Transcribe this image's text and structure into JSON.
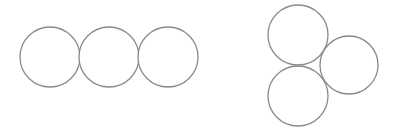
{
  "diagram": {
    "stroke_color": "#8a8a8a",
    "background": "#ffffff",
    "groups": [
      {
        "name": "linear-chain",
        "arrangement": "three circles in a horizontal row, touching",
        "circles": [
          {
            "cx": 50,
            "cy": 57,
            "r": 30
          },
          {
            "cx": 109,
            "cy": 57,
            "r": 30
          },
          {
            "cx": 168,
            "cy": 57,
            "r": 30
          }
        ]
      },
      {
        "name": "triangular-cluster",
        "arrangement": "three circles in a triangular cluster, touching",
        "circles": [
          {
            "cx": 298,
            "cy": 35,
            "r": 30
          },
          {
            "cx": 349,
            "cy": 65,
            "r": 29
          },
          {
            "cx": 298,
            "cy": 96,
            "r": 30
          }
        ]
      }
    ]
  }
}
